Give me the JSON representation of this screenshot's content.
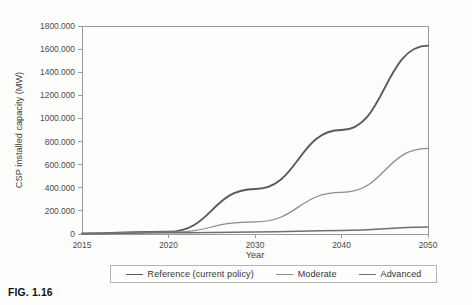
{
  "figure": {
    "caption": "FIG. 1.16"
  },
  "chart_data": {
    "type": "line",
    "title": "",
    "xlabel": "Year",
    "ylabel": "CSP installed capacity (MW)",
    "x": [
      "2015",
      "2020",
      "2030",
      "2040",
      "2050"
    ],
    "categories": [
      "2015",
      "2020",
      "2030",
      "2040",
      "2050"
    ],
    "xtick_labels": [
      "2015",
      "2020",
      "2030",
      "2040",
      "2050"
    ],
    "ytick_labels": [
      "0",
      "200.000",
      "400.000",
      "600.000",
      "800.000",
      "1000.000",
      "1200.000",
      "1400.000",
      "1600.000",
      "1800.000"
    ],
    "ytick_values": [
      0,
      200,
      400,
      600,
      800,
      1000,
      1200,
      1400,
      1600,
      1800
    ],
    "ylim": [
      0,
      1800
    ],
    "grid": false,
    "legend_position": "bottom",
    "series": [
      {
        "name": "Reference (current policy)",
        "values": [
          5,
          20,
          390,
          900,
          1630
        ],
        "color": "#5a5a5a",
        "width": 1.9
      },
      {
        "name": "Moderate",
        "values": [
          4,
          16,
          105,
          360,
          740
        ],
        "color": "#8c8c8c",
        "width": 1.25
      },
      {
        "name": "Advanced",
        "values": [
          3,
          10,
          18,
          30,
          60
        ],
        "color": "#6f6f6f",
        "width": 1.5
      }
    ]
  },
  "legend": {
    "entries": [
      {
        "label": "Reference (current policy)"
      },
      {
        "label": "Moderate"
      },
      {
        "label": "Advanced"
      }
    ]
  }
}
